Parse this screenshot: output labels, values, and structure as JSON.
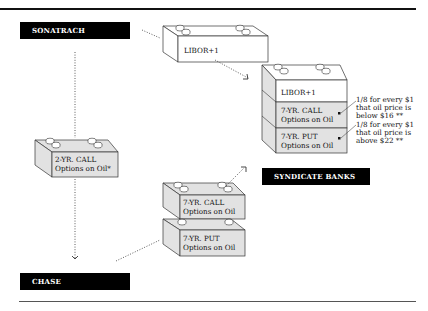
{
  "diagram": {
    "parties": {
      "sonatrach": "SONATRACH",
      "chase": "CHASE",
      "syndicate": "SYNDICATE BANKS"
    },
    "blocks": {
      "libor_single": "LIBOR+1",
      "stack_right": {
        "libor": "LIBOR+1",
        "call_line1": "7-YR. CALL",
        "call_line2": "Options on Oil",
        "put_line1": "7-YR. PUT",
        "put_line2": "Options on Oil"
      },
      "two_yr_call": {
        "line1": "2-YR. CALL",
        "line2": "Options on Oil*"
      },
      "stack_middle": {
        "call_line1": "7-YR. CALL",
        "call_line2": "Options on Oil",
        "put_line1": "7-YR. PUT",
        "put_line2": "Options on Oil"
      }
    },
    "annotations": {
      "call_note": [
        "1/8 for every $1",
        "that oil price is",
        "below $16 **"
      ],
      "put_note": [
        "1/8 for every $1",
        "that oil price is",
        "above $22 **"
      ]
    },
    "colors": {
      "shaded_block": "#e2e2e2",
      "white_block": "#ffffff",
      "label_bg": "#000000"
    }
  }
}
